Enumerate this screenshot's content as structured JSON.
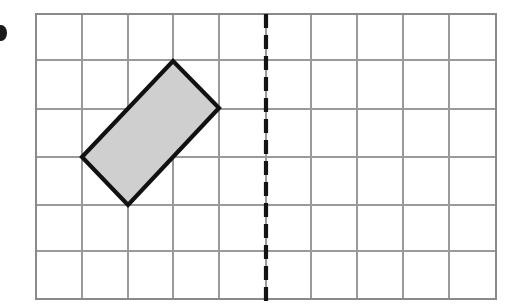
{
  "figure": {
    "title": "Coordinate grid with a shaded rectangle and a vertical dashed line of symmetry",
    "canvas": {
      "width": 517,
      "height": 308,
      "background": "#ffffff"
    },
    "grid": {
      "name": "square-grid",
      "left": 36,
      "top": 14,
      "right": 496,
      "bottom": 299,
      "columns": 10,
      "rows": 6,
      "cell_width": 46,
      "cell_height": 47.5,
      "line_color": "#9a9a9a",
      "border_color": "#8a8a8a",
      "x_lines": [
        36,
        82,
        128,
        173,
        219,
        266,
        311,
        357,
        403,
        449,
        496
      ],
      "y_lines": [
        14,
        60,
        109,
        157,
        205,
        251,
        299
      ]
    },
    "mirror_line": {
      "label": "line of symmetry",
      "orientation": "vertical",
      "x": 266,
      "y_start": 14,
      "y_end": 302,
      "color": "#141414",
      "stroke_width": 4.2,
      "dash_on": 14,
      "dash_off": 7,
      "grid_column_index": 5
    },
    "shape": {
      "label": "shaded rectangle",
      "type": "rectangle",
      "fill": "#cfcfcf",
      "stroke": "#111111",
      "stroke_width": 4.2,
      "vertices": [
        {
          "name": "left-vertex",
          "x": 82,
          "y": 157,
          "grid_col": 1,
          "grid_row": 3
        },
        {
          "name": "top-vertex",
          "x": 173,
          "y": 61,
          "grid_col": 3,
          "grid_row": 1
        },
        {
          "name": "right-vertex",
          "x": 219,
          "y": 108,
          "grid_col": 4,
          "grid_row": 2
        },
        {
          "name": "bottom-vertex",
          "x": 128,
          "y": 205,
          "grid_col": 2,
          "grid_row": 4
        }
      ],
      "points_attr": "82,157 173,61 219,108 128,205"
    },
    "edge_mark": {
      "label": "cropped bullet mark at left page edge",
      "cx": 1,
      "cy": 33,
      "rx": 6,
      "ry": 8,
      "color": "#1a1a1a"
    }
  },
  "chart_data": {
    "type": "scatter",
    "xlabel": "",
    "ylabel": "",
    "grid": true,
    "legend": null,
    "xlim": [
      0,
      10
    ],
    "ylim": [
      0,
      6
    ],
    "x": [
      1,
      3,
      4,
      2
    ],
    "y": [
      3,
      5,
      4,
      2
    ],
    "tick_labels_x": [
      "0",
      "1",
      "2",
      "3",
      "4",
      "5",
      "6",
      "7",
      "8",
      "9",
      "10"
    ],
    "tick_labels_y": [
      "0",
      "1",
      "2",
      "3",
      "4",
      "5",
      "6"
    ],
    "annotations": [
      {
        "name": "shaded-rectangle",
        "kind": "polygon",
        "grid_points": [
          [
            1,
            3
          ],
          [
            3,
            5
          ],
          [
            4,
            4
          ],
          [
            2,
            2
          ]
        ],
        "fill": "#cfcfcf",
        "edge": "#111111"
      },
      {
        "name": "dashed-mirror-line",
        "kind": "vline",
        "grid_x": 5,
        "style": "dashed",
        "color": "#141414"
      }
    ]
  }
}
